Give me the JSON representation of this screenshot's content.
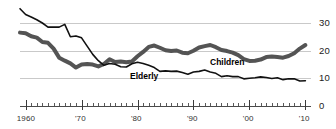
{
  "chart_data": {
    "type": "line",
    "title": "",
    "subtitle": "",
    "xlabel": "",
    "ylabel": "",
    "xlim": [
      1959,
      2011
    ],
    "ylim": [
      0,
      34
    ],
    "grid": "horizontal-only",
    "legend_position": "inline-annotation",
    "y_axis_side": "right",
    "y_ticks": [
      {
        "value": 30,
        "label": "30"
      },
      {
        "value": 20,
        "label": "20"
      },
      {
        "value": 10,
        "label": "10"
      },
      {
        "value": 0,
        "label": "0"
      }
    ],
    "x_ticks": [
      {
        "value": 1960,
        "label": "1960"
      },
      {
        "value": 1970,
        "label": "'70"
      },
      {
        "value": 1980,
        "label": "'80"
      },
      {
        "value": 1990,
        "label": "'90"
      },
      {
        "value": 2000,
        "label": "'00"
      },
      {
        "value": 2010,
        "label": "'10"
      }
    ],
    "x_minor_tick_interval": 1,
    "x": [
      1959,
      1960,
      1961,
      1962,
      1963,
      1964,
      1965,
      1966,
      1967,
      1968,
      1969,
      1970,
      1971,
      1972,
      1973,
      1974,
      1975,
      1976,
      1977,
      1978,
      1979,
      1980,
      1981,
      1982,
      1983,
      1984,
      1985,
      1986,
      1987,
      1988,
      1989,
      1990,
      1991,
      1992,
      1993,
      1994,
      1995,
      1996,
      1997,
      1998,
      1999,
      2000,
      2001,
      2002,
      2003,
      2004,
      2005,
      2006,
      2007,
      2008,
      2009,
      2010
    ],
    "series": [
      {
        "name": "Elderly",
        "color": "#111111",
        "style": "thin-solid",
        "label_text": "Elderly",
        "values": [
          35.2,
          33.1,
          32.2,
          31.2,
          30.0,
          28.5,
          28.5,
          28.5,
          29.5,
          25.0,
          25.3,
          24.6,
          21.6,
          18.6,
          16.3,
          14.6,
          15.3,
          15.0,
          14.1,
          14.0,
          15.2,
          15.7,
          15.3,
          14.6,
          13.8,
          12.4,
          12.6,
          12.4,
          12.5,
          12.0,
          11.4,
          12.2,
          12.4,
          12.9,
          12.2,
          11.7,
          10.5,
          10.8,
          10.5,
          10.5,
          9.7,
          9.9,
          10.1,
          10.4,
          10.2,
          9.8,
          10.1,
          9.4,
          9.7,
          9.7,
          8.9,
          9.0
        ]
      },
      {
        "name": "Children",
        "color": "#545454",
        "style": "thick-solid",
        "label_text": "Children",
        "values": [
          26.5,
          26.3,
          25.2,
          24.7,
          23.1,
          22.8,
          20.7,
          17.4,
          16.3,
          15.3,
          13.8,
          14.9,
          15.1,
          14.9,
          14.2,
          15.1,
          16.8,
          15.8,
          16.0,
          15.7,
          16.0,
          17.9,
          19.5,
          21.3,
          21.8,
          21.0,
          20.1,
          19.8,
          20.0,
          19.2,
          19.0,
          19.9,
          21.1,
          21.6,
          22.0,
          21.2,
          20.2,
          19.8,
          19.2,
          18.3,
          16.9,
          16.2,
          16.3,
          16.7,
          17.6,
          17.8,
          17.6,
          17.4,
          18.0,
          19.0,
          20.7,
          22.0
        ]
      }
    ],
    "annotations": [
      {
        "text": "Elderly",
        "x_px": 130,
        "y_px": 72
      },
      {
        "text": "Children",
        "x_px": 210,
        "y_px": 58
      }
    ]
  },
  "colors": {
    "background": "#ffffff",
    "gridline": "#c9c9c9",
    "axis": "#4a4a4a",
    "elderly": "#111111",
    "children": "#545454",
    "text": "#222222"
  }
}
